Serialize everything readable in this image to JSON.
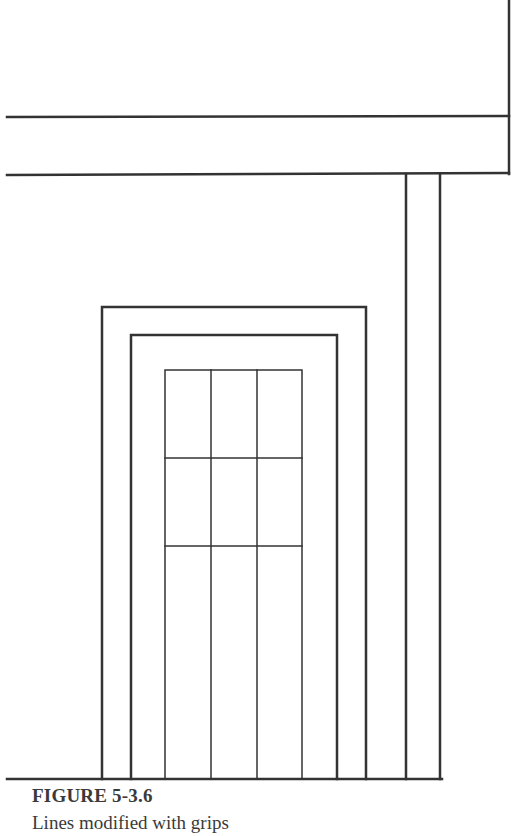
{
  "figure": {
    "label": "FIGURE 5-3.6",
    "caption": "Lines modified with grips"
  },
  "drawing": {
    "stroke_color": "#333333",
    "description": "Elevation of a doorway: roof fascia band, two vertical posts, double door frame and a paneled door",
    "elements": {
      "fascia_top_line_y": 117,
      "fascia_bottom_line_y": 174,
      "fascia_right_x": 509,
      "posts_x": [
        406,
        440
      ],
      "outer_frame": {
        "left": 102,
        "right": 366,
        "top": 307
      },
      "inner_frame": {
        "left": 131,
        "right": 337,
        "top": 335
      },
      "door": {
        "left": 165,
        "right": 302,
        "top": 370,
        "mullions_x": [
          211,
          257
        ],
        "rails_y": [
          458,
          546
        ]
      },
      "ground_line_y": 779
    }
  }
}
